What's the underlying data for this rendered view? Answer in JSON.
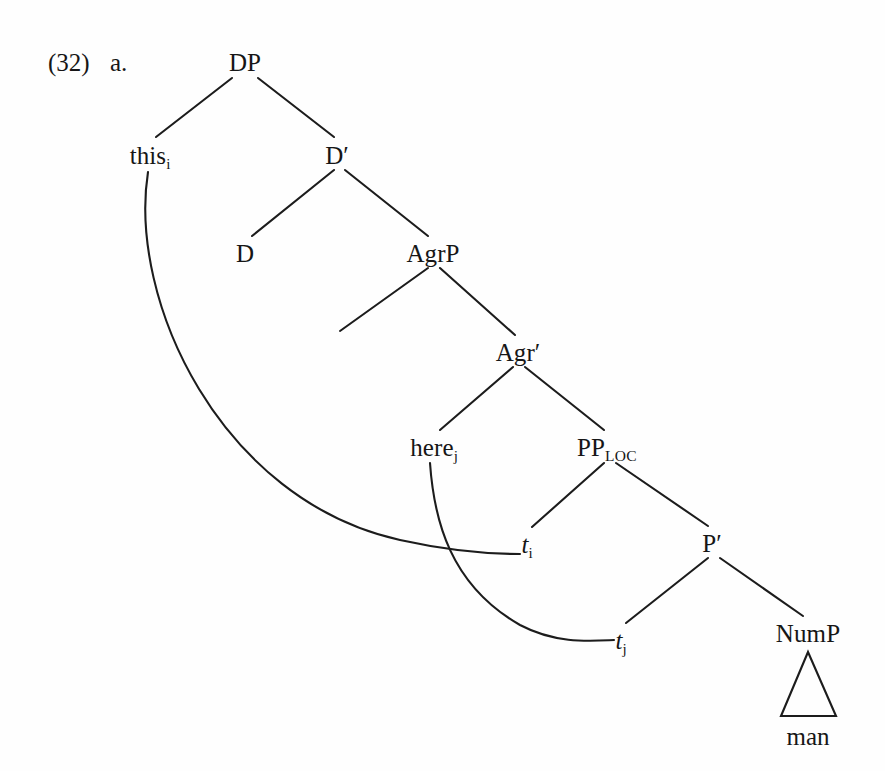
{
  "example": {
    "number": "(32)",
    "sublabel": "a."
  },
  "tree": {
    "nodes": [
      {
        "id": "DP",
        "label": "DP",
        "x": 245,
        "y": 62,
        "sub": "",
        "italic": false,
        "smallcaps": ""
      },
      {
        "id": "this",
        "label": "this",
        "x": 150,
        "y": 155,
        "sub": "i",
        "italic": false,
        "smallcaps": ""
      },
      {
        "id": "Dbar",
        "label": "D′",
        "x": 337,
        "y": 155,
        "sub": "",
        "italic": false,
        "smallcaps": ""
      },
      {
        "id": "D",
        "label": "D",
        "x": 245,
        "y": 253,
        "sub": "",
        "italic": false,
        "smallcaps": ""
      },
      {
        "id": "AgrP",
        "label": "AgrP",
        "x": 433,
        "y": 253,
        "sub": "",
        "italic": false,
        "smallcaps": ""
      },
      {
        "id": "Agrbar",
        "label": "Agr′",
        "x": 518,
        "y": 352,
        "sub": "",
        "italic": false,
        "smallcaps": ""
      },
      {
        "id": "here",
        "label": "here",
        "x": 434,
        "y": 447,
        "sub": "j",
        "italic": false,
        "smallcaps": ""
      },
      {
        "id": "PPLOC",
        "label": "PP",
        "x": 607,
        "y": 447,
        "sub": "",
        "italic": false,
        "smallcaps": "LOC"
      },
      {
        "id": "ti",
        "label": "t",
        "x": 527,
        "y": 544,
        "sub": "i",
        "italic": true,
        "smallcaps": ""
      },
      {
        "id": "Pbar",
        "label": "P′",
        "x": 712,
        "y": 543,
        "sub": "",
        "italic": false,
        "smallcaps": ""
      },
      {
        "id": "tj",
        "label": "t",
        "x": 621,
        "y": 640,
        "sub": "j",
        "italic": true,
        "smallcaps": ""
      },
      {
        "id": "NumP",
        "label": "NumP",
        "x": 808,
        "y": 633,
        "sub": "",
        "italic": false,
        "smallcaps": ""
      }
    ],
    "branches": [
      {
        "name": "dp-to-this",
        "x1": 232,
        "y1": 78,
        "x2": 156,
        "y2": 137
      },
      {
        "name": "dp-to-dbar",
        "x1": 258,
        "y1": 78,
        "x2": 334,
        "y2": 137
      },
      {
        "name": "dbar-to-d",
        "x1": 334,
        "y1": 170,
        "x2": 252,
        "y2": 236
      },
      {
        "name": "dbar-to-agrp",
        "x1": 345,
        "y1": 170,
        "x2": 428,
        "y2": 236
      },
      {
        "name": "agrp-to-spec",
        "x1": 428,
        "y1": 268,
        "x2": 340,
        "y2": 331
      },
      {
        "name": "agrp-to-agrbar",
        "x1": 440,
        "y1": 268,
        "x2": 515,
        "y2": 335
      },
      {
        "name": "agrbar-to-here",
        "x1": 513,
        "y1": 367,
        "x2": 440,
        "y2": 430
      },
      {
        "name": "agrbar-to-pploc",
        "x1": 525,
        "y1": 367,
        "x2": 604,
        "y2": 430
      },
      {
        "name": "pploc-to-ti",
        "x1": 604,
        "y1": 463,
        "x2": 532,
        "y2": 527
      },
      {
        "name": "pploc-to-pbar",
        "x1": 616,
        "y1": 463,
        "x2": 708,
        "y2": 526
      },
      {
        "name": "pbar-to-tj",
        "x1": 708,
        "y1": 558,
        "x2": 626,
        "y2": 623
      },
      {
        "name": "pbar-to-nump",
        "x1": 720,
        "y1": 558,
        "x2": 803,
        "y2": 616
      }
    ],
    "movement_arcs": [
      {
        "name": "arc-this-to-ti",
        "path": "M 148,172 C 128,300 220,500 400,540 C 450,551 490,554 520,554"
      },
      {
        "name": "arc-here-to-tj",
        "path": "M 430,463 C 434,520 450,585 520,625 C 556,644 590,641 614,640"
      }
    ],
    "triangle": {
      "name": "nump-triangle",
      "apex_x": 808,
      "apex_y": 652,
      "left_x": 781,
      "left_y": 716,
      "right_x": 836,
      "right_y": 716
    },
    "terminals": [
      {
        "name": "terminal-man",
        "label": "man",
        "x": 808,
        "y": 736
      }
    ],
    "line_color": "#1c1c1c",
    "line_width": 2.1
  }
}
